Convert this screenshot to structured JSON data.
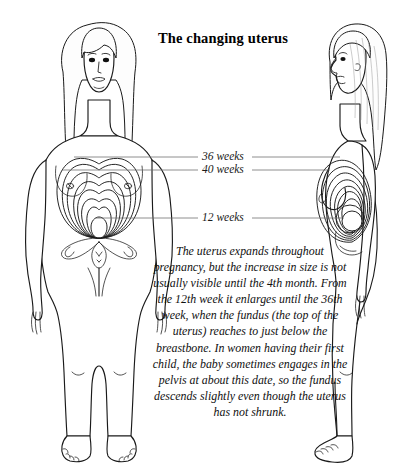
{
  "figure": {
    "title": "The changing uterus",
    "background_color": "#ffffff",
    "ink_color": "#1a1a1a",
    "type": "anatomical-illustration",
    "views": [
      {
        "name": "front-view-figure",
        "orientation": "anterior",
        "side": "left"
      },
      {
        "name": "side-view-figure",
        "orientation": "lateral profile facing left",
        "side": "right"
      }
    ],
    "labels": [
      {
        "id": "wk36",
        "text": "36 weeks",
        "y": 157
      },
      {
        "id": "wk40",
        "text": "40 weeks",
        "y": 170
      },
      {
        "id": "wk12",
        "text": "12 weeks",
        "y": 218
      }
    ],
    "caption": "The uterus expands throughout pregnancy, but the increase in size is not usually visible until the 4th month. From the 12th week it enlarges until the 36th week, when the fundus (the top of the uterus) reaches to just below the breastbone. In women having their first child, the baby sometimes engages in the pelvis at about this date, so the fundus descends slightly even though the uterus has not shrunk."
  }
}
